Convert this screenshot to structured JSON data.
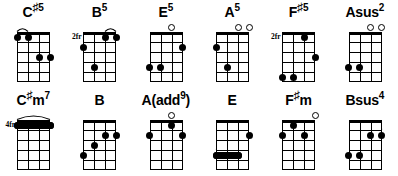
{
  "document": {
    "title": "Ukulele Chord Chart",
    "background_color": "#ffffff",
    "ink_color": "#000000",
    "rows": 2,
    "columns": 6,
    "instrument_strings": 4,
    "frets_shown": 5
  },
  "chords": [
    {
      "name": "C#5",
      "root": "C",
      "accidental": "♯",
      "quality_superscript": "5",
      "position_label": "",
      "open_strings": [],
      "dots": [
        {
          "string": 1,
          "fret": 1
        },
        {
          "string": 2,
          "fret": 1
        },
        {
          "string": 3,
          "fret": 3
        },
        {
          "string": 4,
          "fret": 3
        }
      ],
      "ties": [
        {
          "from_string": 1,
          "to_string": 2,
          "fret": 1
        },
        {
          "from_string": 3,
          "to_string": 4,
          "fret": 3
        }
      ]
    },
    {
      "name": "B5",
      "root": "B",
      "accidental": "",
      "quality_superscript": "5",
      "position_label": "2fr",
      "open_strings": [],
      "dots": [
        {
          "string": 3,
          "fret": 1
        },
        {
          "string": 4,
          "fret": 1
        },
        {
          "string": 1,
          "fret": 2
        },
        {
          "string": 2,
          "fret": 4
        }
      ],
      "ties": [
        {
          "from_string": 3,
          "to_string": 4,
          "fret": 1
        }
      ]
    },
    {
      "name": "E5",
      "root": "E",
      "accidental": "",
      "quality_superscript": "5",
      "position_label": "",
      "open_strings": [
        3
      ],
      "dots": [
        {
          "string": 4,
          "fret": 2
        },
        {
          "string": 1,
          "fret": 4
        },
        {
          "string": 2,
          "fret": 4
        }
      ],
      "ties": []
    },
    {
      "name": "A5",
      "root": "A",
      "accidental": "",
      "quality_superscript": "5",
      "position_label": "",
      "open_strings": [
        3,
        4
      ],
      "dots": [
        {
          "string": 1,
          "fret": 2
        },
        {
          "string": 2,
          "fret": 4
        }
      ],
      "ties": []
    },
    {
      "name": "F#5",
      "root": "F",
      "accidental": "♯",
      "quality_superscript": "5",
      "position_label": "2fr",
      "open_strings": [],
      "dots": [
        {
          "string": 3,
          "fret": 1
        },
        {
          "string": 4,
          "fret": 3
        },
        {
          "string": 1,
          "fret": 5
        },
        {
          "string": 2,
          "fret": 5
        }
      ],
      "ties": []
    },
    {
      "name": "Asus2",
      "root": "Asus",
      "accidental": "",
      "quality_superscript": "2",
      "position_label": "",
      "open_strings": [
        3,
        4
      ],
      "dots": [
        {
          "string": 1,
          "fret": 4
        },
        {
          "string": 2,
          "fret": 4
        }
      ],
      "ties": []
    },
    {
      "name": "C#m7",
      "root": "C",
      "accidental": "♯",
      "root_suffix": "m",
      "quality_superscript": "7",
      "position_label": "4fr",
      "open_strings": [],
      "dots": [],
      "barres": [
        {
          "from_string": 1,
          "to_string": 4,
          "fret": 1
        }
      ],
      "ties": [
        {
          "from_string": 1,
          "to_string": 4,
          "fret": 1
        }
      ]
    },
    {
      "name": "B",
      "root": "B",
      "accidental": "",
      "quality_superscript": "",
      "position_label": "",
      "open_strings": [],
      "dots": [
        {
          "string": 3,
          "fret": 2
        },
        {
          "string": 4,
          "fret": 2
        },
        {
          "string": 2,
          "fret": 3
        },
        {
          "string": 1,
          "fret": 4
        }
      ],
      "ties": [
        {
          "from_string": 3,
          "to_string": 4,
          "fret": 2
        }
      ]
    },
    {
      "name": "A(add9)",
      "root": "A",
      "accidental": "",
      "paren_text": "(add",
      "quality_superscript": "9",
      "paren_close": ")",
      "position_label": "",
      "open_strings": [
        3
      ],
      "dots": [
        {
          "string": 3,
          "fret": 1
        },
        {
          "string": 1,
          "fret": 2
        },
        {
          "string": 4,
          "fret": 2
        }
      ],
      "ties": []
    },
    {
      "name": "E",
      "root": "E",
      "accidental": "",
      "quality_superscript": "",
      "position_label": "",
      "open_strings": [],
      "dots": [
        {
          "string": 4,
          "fret": 2
        }
      ],
      "barres": [
        {
          "from_string": 1,
          "to_string": 3,
          "fret": 4
        }
      ],
      "ties": [
        {
          "from_string": 1,
          "to_string": 3,
          "fret": 4
        }
      ]
    },
    {
      "name": "F#m",
      "root": "F",
      "accidental": "♯",
      "root_suffix": "m",
      "quality_superscript": "",
      "position_label": "",
      "open_strings": [
        4
      ],
      "dots": [
        {
          "string": 2,
          "fret": 1
        },
        {
          "string": 1,
          "fret": 2
        },
        {
          "string": 3,
          "fret": 2
        }
      ],
      "ties": []
    },
    {
      "name": "Bsus4",
      "root": "Bsus",
      "accidental": "",
      "quality_superscript": "4",
      "position_label": "",
      "open_strings": [],
      "dots": [
        {
          "string": 3,
          "fret": 2
        },
        {
          "string": 4,
          "fret": 2
        },
        {
          "string": 1,
          "fret": 4
        },
        {
          "string": 2,
          "fret": 4
        }
      ],
      "ties": [
        {
          "from_string": 3,
          "to_string": 4,
          "fret": 2
        }
      ]
    }
  ]
}
